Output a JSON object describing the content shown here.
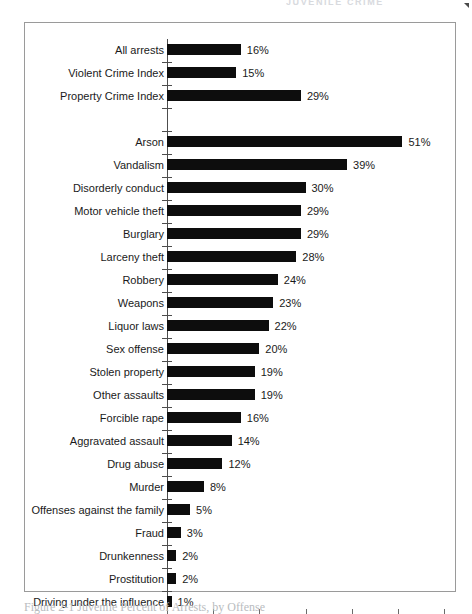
{
  "page": {
    "running_head": "JUVENILE CRIME",
    "caption": "Figure 2-1   Juvenile Percent of Arrests, by Offense"
  },
  "chart_data": {
    "type": "bar",
    "orientation": "horizontal",
    "title": "",
    "xlabel": "Percent of arrests involving juveniles",
    "ylabel": "",
    "xlim": [
      0,
      60
    ],
    "xticks": [
      0,
      10,
      20,
      30,
      40,
      50,
      60
    ],
    "xtick_labels": [
      "0%",
      "10%",
      "20%",
      "30%",
      "40%",
      "50%",
      "60%"
    ],
    "grid": false,
    "legend": null,
    "bar_color": "#0d0d0d",
    "value_suffix": "%",
    "categories": [
      "All arrests",
      "Violent Crime Index",
      "Property Crime Index",
      "",
      "Arson",
      "Vandalism",
      "Disorderly conduct",
      "Motor vehicle theft",
      "Burglary",
      "Larceny theft",
      "Robbery",
      "Weapons",
      "Liquor laws",
      "Sex offense",
      "Stolen property",
      "Other assaults",
      "Forcible rape",
      "Aggravated assault",
      "Drug abuse",
      "Murder",
      "Offenses against the family",
      "Fraud",
      "Drunkenness",
      "Prostitution",
      "Driving under the influence"
    ],
    "values": [
      16,
      15,
      29,
      null,
      51,
      39,
      30,
      29,
      29,
      28,
      24,
      23,
      22,
      20,
      19,
      19,
      16,
      14,
      12,
      8,
      5,
      3,
      2,
      2,
      1
    ],
    "value_labels": [
      "16%",
      "15%",
      "29%",
      "",
      "51%",
      "39%",
      "30%",
      "29%",
      "29%",
      "28%",
      "24%",
      "23%",
      "22%",
      "20%",
      "19%",
      "19%",
      "16%",
      "14%",
      "12%",
      "8%",
      "5%",
      "3%",
      "2%",
      "2%",
      "1%"
    ],
    "rows": [
      {
        "label": "All arrests",
        "value": 16,
        "value_label": "16%",
        "spacer": false
      },
      {
        "label": "Violent Crime Index",
        "value": 15,
        "value_label": "15%",
        "spacer": false
      },
      {
        "label": "Property Crime Index",
        "value": 29,
        "value_label": "29%",
        "spacer": false
      },
      {
        "label": "",
        "value": 0,
        "value_label": "",
        "spacer": true
      },
      {
        "label": "Arson",
        "value": 51,
        "value_label": "51%",
        "spacer": false
      },
      {
        "label": "Vandalism",
        "value": 39,
        "value_label": "39%",
        "spacer": false
      },
      {
        "label": "Disorderly conduct",
        "value": 30,
        "value_label": "30%",
        "spacer": false
      },
      {
        "label": "Motor vehicle theft",
        "value": 29,
        "value_label": "29%",
        "spacer": false
      },
      {
        "label": "Burglary",
        "value": 29,
        "value_label": "29%",
        "spacer": false
      },
      {
        "label": "Larceny theft",
        "value": 28,
        "value_label": "28%",
        "spacer": false
      },
      {
        "label": "Robbery",
        "value": 24,
        "value_label": "24%",
        "spacer": false
      },
      {
        "label": "Weapons",
        "value": 23,
        "value_label": "23%",
        "spacer": false
      },
      {
        "label": "Liquor laws",
        "value": 22,
        "value_label": "22%",
        "spacer": false
      },
      {
        "label": "Sex offense",
        "value": 20,
        "value_label": "20%",
        "spacer": false
      },
      {
        "label": "Stolen property",
        "value": 19,
        "value_label": "19%",
        "spacer": false
      },
      {
        "label": "Other assaults",
        "value": 19,
        "value_label": "19%",
        "spacer": false
      },
      {
        "label": "Forcible rape",
        "value": 16,
        "value_label": "16%",
        "spacer": false
      },
      {
        "label": "Aggravated assault",
        "value": 14,
        "value_label": "14%",
        "spacer": false
      },
      {
        "label": "Drug abuse",
        "value": 12,
        "value_label": "12%",
        "spacer": false
      },
      {
        "label": "Murder",
        "value": 8,
        "value_label": "8%",
        "spacer": false
      },
      {
        "label": "Offenses against the family",
        "value": 5,
        "value_label": "5%",
        "spacer": false
      },
      {
        "label": "Fraud",
        "value": 3,
        "value_label": "3%",
        "spacer": false
      },
      {
        "label": "Drunkenness",
        "value": 2,
        "value_label": "2%",
        "spacer": false
      },
      {
        "label": "Prostitution",
        "value": 2,
        "value_label": "2%",
        "spacer": false
      },
      {
        "label": "Driving under the influence",
        "value": 1,
        "value_label": "1%",
        "spacer": false
      }
    ]
  }
}
